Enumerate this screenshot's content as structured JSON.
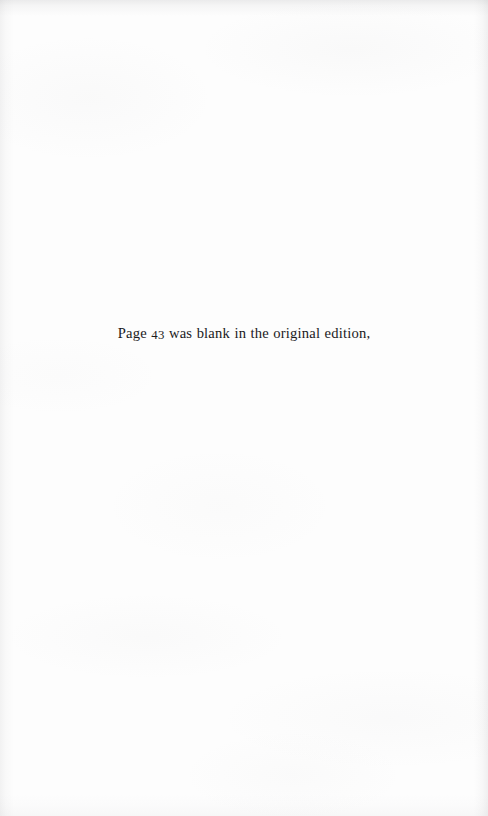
{
  "page": {
    "kind": "scanned-book-page",
    "width": 488,
    "height": 816,
    "background_color": "#fdfdfd",
    "text_color": "#1a1a1c"
  },
  "note": {
    "full_text": "Page 43 was blank in the original edition,",
    "before_number": "Page ",
    "page_number": "43",
    "after_number": " was blank in the original edition,"
  }
}
